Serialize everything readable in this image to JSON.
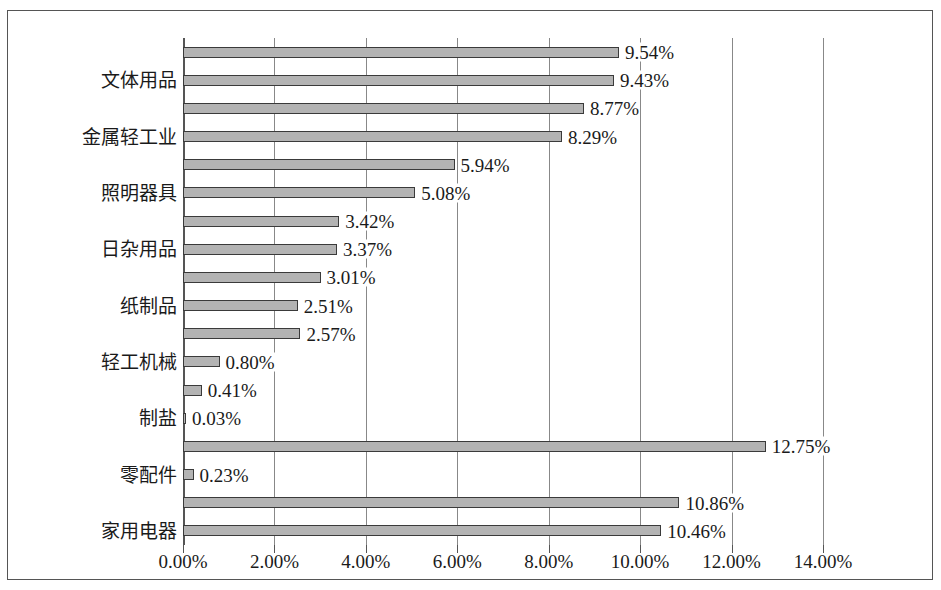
{
  "chart_data": {
    "type": "bar",
    "orientation": "horizontal",
    "title": "",
    "xlabel": "",
    "ylabel": "",
    "xlim": [
      0,
      14
    ],
    "xtick_labels": [
      "0.00%",
      "2.00%",
      "4.00%",
      "6.00%",
      "8.00%",
      "10.00%",
      "12.00%",
      "14.00%"
    ],
    "xtick_values": [
      0,
      2,
      4,
      6,
      8,
      10,
      12,
      14
    ],
    "grid": true,
    "legend": "none",
    "categories": [
      "文体用品",
      "金属轻工业",
      "照明器具",
      "日杂用品",
      "纸制品",
      "轻工机械",
      "制盐",
      "零配件",
      "家用电器"
    ],
    "bar_color": "#b3b3b3",
    "bar_edge_color": "#3a3a3a",
    "bars": [
      {
        "value": 9.54,
        "label": "9.54%"
      },
      {
        "value": 9.43,
        "label": "9.43%"
      },
      {
        "value": 8.77,
        "label": "8.77%"
      },
      {
        "value": 8.29,
        "label": "8.29%"
      },
      {
        "value": 5.94,
        "label": "5.94%"
      },
      {
        "value": 5.08,
        "label": "5.08%"
      },
      {
        "value": 3.42,
        "label": "3.42%"
      },
      {
        "value": 3.37,
        "label": "3.37%"
      },
      {
        "value": 3.01,
        "label": "3.01%"
      },
      {
        "value": 2.51,
        "label": "2.51%"
      },
      {
        "value": 2.57,
        "label": "2.57%"
      },
      {
        "value": 0.8,
        "label": "0.80%"
      },
      {
        "value": 0.41,
        "label": "0.41%"
      },
      {
        "value": 0.03,
        "label": "0.03%"
      },
      {
        "value": 12.75,
        "label": "12.75%"
      },
      {
        "value": 0.23,
        "label": "0.23%"
      },
      {
        "value": 10.86,
        "label": "10.86%"
      },
      {
        "value": 10.46,
        "label": "10.46%"
      }
    ]
  }
}
